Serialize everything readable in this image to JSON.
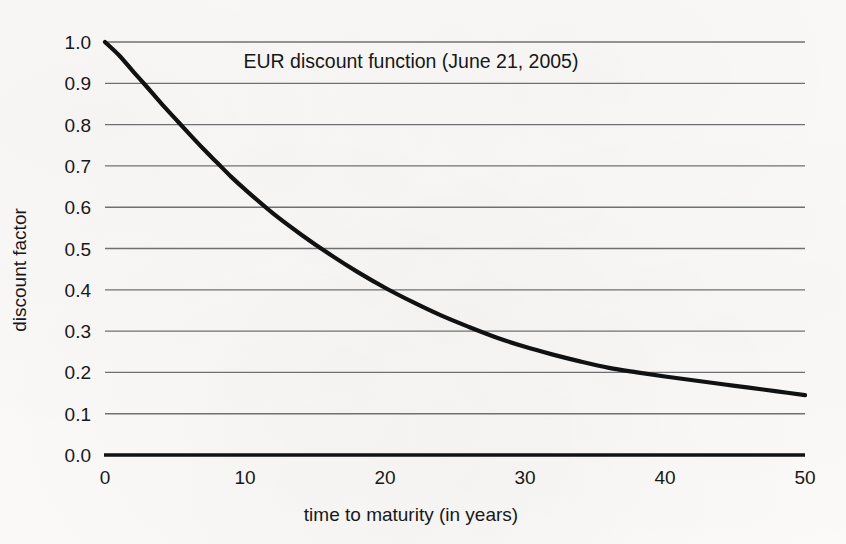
{
  "chart_data": {
    "type": "line",
    "title": "EUR discount function (June 21, 2005)",
    "xlabel": "time to maturity (in years)",
    "ylabel": "discount factor",
    "xlim": [
      0,
      50
    ],
    "ylim": [
      0.0,
      1.0
    ],
    "grid": true,
    "grid_axis": "y",
    "legend": "none",
    "xticks": [
      0,
      10,
      20,
      30,
      40,
      50
    ],
    "xtick_labels": [
      "0",
      "10",
      "20",
      "30",
      "40",
      "50"
    ],
    "yticks": [
      0.0,
      0.1,
      0.2,
      0.3,
      0.4,
      0.5,
      0.6,
      0.7,
      0.8,
      0.9,
      1.0
    ],
    "ytick_labels": [
      "0.0",
      "0.1",
      "0.2",
      "0.3",
      "0.4",
      "0.5",
      "0.6",
      "0.7",
      "0.8",
      "0.9",
      "1.0"
    ],
    "series": [
      {
        "name": "EUR discount function",
        "color": "#101113",
        "x": [
          0,
          1,
          2,
          3,
          4,
          5,
          6,
          7,
          8,
          9,
          10,
          12,
          14,
          16,
          18,
          20,
          22,
          24,
          26,
          28,
          30,
          32,
          34,
          36,
          38,
          40,
          42,
          44,
          46,
          48,
          50
        ],
        "y": [
          1.0,
          0.968,
          0.929,
          0.891,
          0.852,
          0.815,
          0.778,
          0.742,
          0.708,
          0.674,
          0.643,
          0.585,
          0.534,
          0.487,
          0.444,
          0.405,
          0.37,
          0.338,
          0.31,
          0.284,
          0.262,
          0.243,
          0.226,
          0.211,
          0.2,
          0.19,
          0.181,
          0.172,
          0.163,
          0.154,
          0.145
        ]
      }
    ],
    "zero_baseline": {
      "name": "zero axis line",
      "value": 0.0
    },
    "annotations": [
      {
        "label": "value at 0 years",
        "x": 0,
        "y": 1.0
      },
      {
        "label": "crosses 0.9 near",
        "x": 2.7,
        "y": 0.9
      },
      {
        "label": "crosses 0.8 near",
        "x": 5.7,
        "y": 0.8
      },
      {
        "label": "crosses 0.7 near",
        "x": 9.1,
        "y": 0.7
      },
      {
        "label": "crosses 0.6 near",
        "x": 13.6,
        "y": 0.6
      },
      {
        "label": "crosses 0.5 near",
        "x": 18.2,
        "y": 0.5
      },
      {
        "label": "crosses 0.4 near",
        "x": 23.8,
        "y": 0.4
      },
      {
        "label": "crosses 0.3 near",
        "x": 30.9,
        "y": 0.3
      },
      {
        "label": "crosses 0.2 near",
        "x": 39.6,
        "y": 0.2
      },
      {
        "label": "value at 50 years",
        "x": 50,
        "y": 0.145
      }
    ]
  },
  "colors": {
    "page_background": "#fbfaf8",
    "ink": "#17181a",
    "gridline": "#6e7073",
    "curve": "#101113"
  }
}
